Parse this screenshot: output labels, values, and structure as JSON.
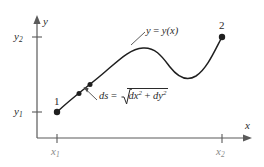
{
  "figure": {
    "kind": "math-diagram",
    "background_color": "#ffffff",
    "ink_color": "#2b2b2b",
    "width": 264,
    "height": 167
  },
  "axes": {
    "x_axis_label": "x",
    "y_axis_label": "y",
    "origin_px": [
      37,
      138
    ],
    "x_ticks": [
      {
        "id": "x1",
        "base": "x",
        "sub": "1",
        "x_px": 57
      },
      {
        "id": "x2",
        "base": "x",
        "sub": "2",
        "x_px": 222
      }
    ],
    "y_ticks": [
      {
        "id": "y1",
        "base": "y",
        "sub": "1",
        "y_px": 112
      },
      {
        "id": "y2",
        "base": "y",
        "sub": "2",
        "y_px": 37
      }
    ]
  },
  "curve": {
    "label": "y = y(x)",
    "label_parts": {
      "lhs": "y",
      "eq": " = ",
      "rhs_fn": "y",
      "rhs_arg": "(x)"
    },
    "path": "M 57,112 C 75,96 92,84 108,70 C 122,58 130,50 142,48 C 156,46 163,56 170,66 C 177,76 186,82 196,76 C 207,69 214,50 222,37",
    "stroke_width": 1.4
  },
  "points": [
    {
      "label": "1",
      "x_px": 57,
      "y_px": 112,
      "role": "start-endpoint"
    },
    {
      "label": "2",
      "x_px": 222,
      "y_px": 37,
      "role": "end-endpoint"
    }
  ],
  "segment_markers": [
    {
      "id": "ds-start",
      "x_px": 79,
      "y_px": 93
    },
    {
      "id": "ds-end",
      "x_px": 90,
      "y_px": 84
    }
  ],
  "annotations": {
    "arc_length": {
      "text": "ds = √(dx² + dy²)",
      "lhs": "ds",
      "eq": " = ",
      "radicand": {
        "term1_base": "dx",
        "term1_exp": "2",
        "plus": " + ",
        "term2_base": "dy",
        "term2_exp": "2"
      },
      "leader_from_px": [
        96,
        99
      ],
      "leader_to_px": [
        84,
        89
      ]
    },
    "curve_name": {
      "text": "y = y(x)",
      "leader_from_px": [
        132,
        44
      ],
      "leader_to_px": [
        144,
        33
      ]
    }
  }
}
